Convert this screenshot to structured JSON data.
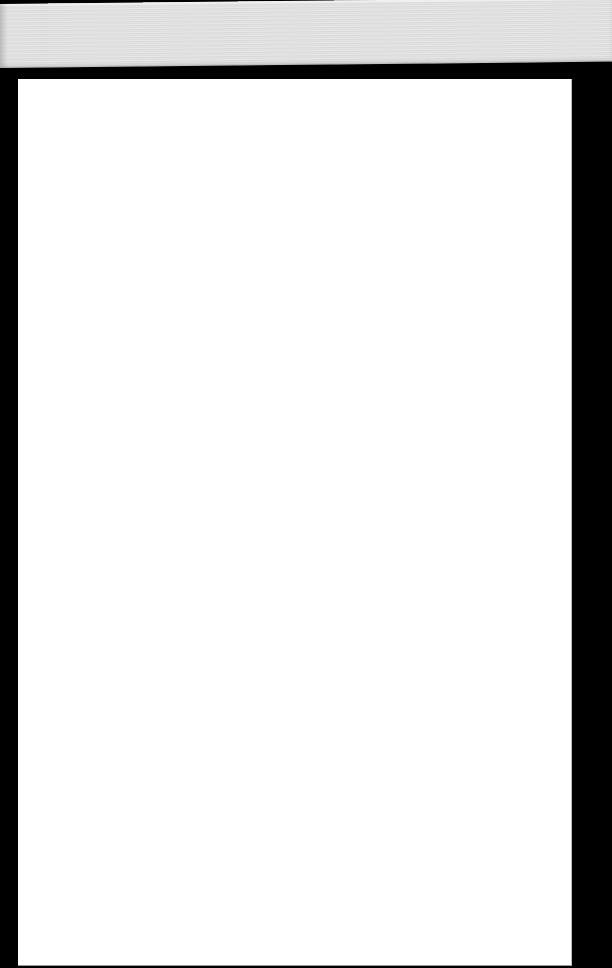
{
  "document": {
    "page_text": "",
    "background_color": "#000000",
    "page_color": "#ffffff",
    "edge_color": "#dedede"
  }
}
